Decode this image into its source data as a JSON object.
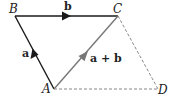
{
  "diagram": {
    "type": "vector-addition-parallelogram",
    "points": {
      "A": {
        "label": "A",
        "x": 54,
        "y": 89
      },
      "B": {
        "label": "B",
        "x": 15,
        "y": 16
      },
      "C": {
        "label": "C",
        "x": 118,
        "y": 16
      },
      "D": {
        "label": "D",
        "x": 158,
        "y": 89
      }
    },
    "vectors": [
      {
        "id": "a",
        "from": "A",
        "to": "B",
        "label": "a",
        "color": "#1a1a1a",
        "style": "solid"
      },
      {
        "id": "b",
        "from": "B",
        "to": "C",
        "label": "b",
        "color": "#1a1a1a",
        "style": "solid"
      },
      {
        "id": "a_plus_b",
        "from": "A",
        "to": "C",
        "label": "a + b",
        "color": "#777777",
        "style": "solid"
      }
    ],
    "dashed_edges": [
      {
        "from": "C",
        "to": "D",
        "color": "#888888"
      },
      {
        "from": "A",
        "to": "D",
        "color": "#888888"
      }
    ]
  }
}
